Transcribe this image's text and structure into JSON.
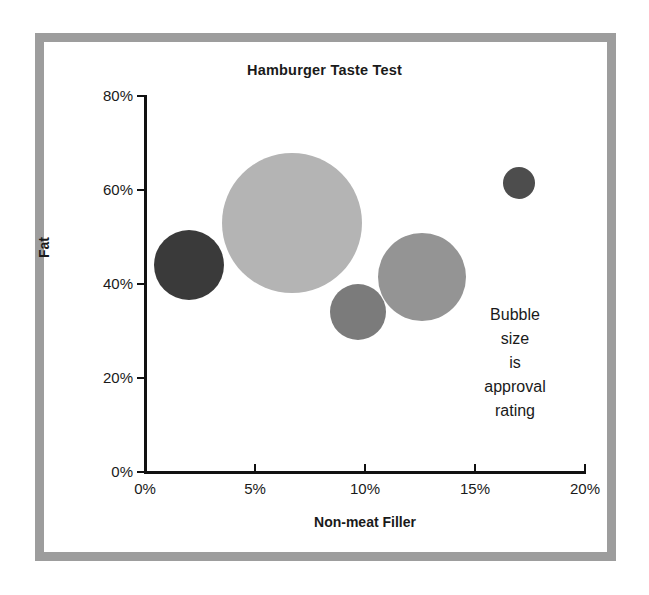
{
  "chart_data": {
    "type": "scatter",
    "subtype": "bubble",
    "title": "Hamburger Taste Test",
    "xlabel": "Non-meat Filler",
    "ylabel": "Fat",
    "xlim": [
      0,
      20
    ],
    "ylim": [
      0,
      80
    ],
    "x_ticks": [
      "0%",
      "5%",
      "10%",
      "15%",
      "20%"
    ],
    "x_tick_values": [
      0,
      5,
      10,
      15,
      20
    ],
    "y_ticks": [
      "0%",
      "20%",
      "40%",
      "60%",
      "80%"
    ],
    "y_tick_values": [
      0,
      20,
      40,
      60,
      80
    ],
    "grid": false,
    "legend": false,
    "annotation": "Bubble size is approval rating",
    "annotation_lines": [
      "Bubble",
      "size",
      "is",
      "approval",
      "rating"
    ],
    "size_meaning": "approval rating",
    "points": [
      {
        "label": "burger-1",
        "x": 2.0,
        "y": 44,
        "size": 35,
        "color": "#3a3a3a"
      },
      {
        "label": "burger-2",
        "x": 6.7,
        "y": 53,
        "size": 70,
        "color": "#b4b4b4"
      },
      {
        "label": "burger-3",
        "x": 9.7,
        "y": 34,
        "size": 28,
        "color": "#7b7b7b"
      },
      {
        "label": "burger-4",
        "x": 12.6,
        "y": 41.5,
        "size": 44,
        "color": "#949494"
      },
      {
        "label": "burger-5",
        "x": 17.0,
        "y": 61.5,
        "size": 16,
        "color": "#4d4d4d"
      }
    ]
  },
  "figure": {
    "frame_color": "#9d9d9d",
    "background": "#ffffff",
    "axis_color": "#111111"
  }
}
